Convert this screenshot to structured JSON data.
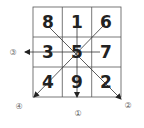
{
  "diagram": {
    "type": "magic-square-flying-star",
    "grid": [
      [
        "8",
        "1",
        "6"
      ],
      [
        "3",
        "5",
        "7"
      ],
      [
        "4",
        "9",
        "2"
      ]
    ],
    "arrows": [
      {
        "label": "①",
        "direction": "down"
      },
      {
        "label": "②",
        "direction": "down-right"
      },
      {
        "label": "③",
        "direction": "left"
      },
      {
        "label": "④",
        "direction": "down-left"
      }
    ],
    "colors": {
      "line": "#555555",
      "text": "#222222",
      "label": "#666666"
    }
  }
}
